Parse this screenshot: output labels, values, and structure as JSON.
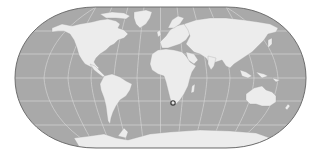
{
  "map": {
    "projection": "pseudo-cylindrical world map (Eckert IV style)",
    "colors": {
      "ocean": "#a9a9a9",
      "land": "#ececec",
      "graticule": "#d4d4d4",
      "outline": "#6e6e6e",
      "marker": "#3a3a3a"
    },
    "graticule": {
      "latitudes": [
        60,
        30,
        0,
        -30,
        -60
      ],
      "longitudes": [
        -150,
        -120,
        -90,
        -60,
        -30,
        0,
        30,
        60,
        90,
        120,
        150
      ]
    },
    "marker": {
      "label": "location-marker",
      "region": "South Africa (Cape of Good Hope)",
      "x": 173,
      "y": 103
    }
  }
}
